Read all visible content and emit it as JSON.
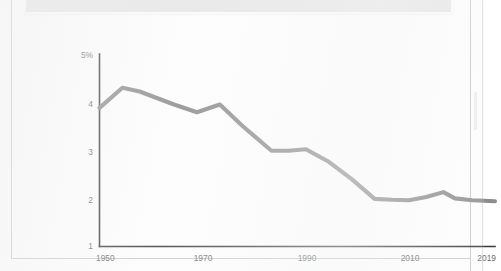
{
  "document": {
    "surface_color": "#fdfdfd",
    "frame_color": "#c9c9c9",
    "top_panel_color": "#e6e6e6"
  },
  "chart_data": {
    "type": "line",
    "title": "",
    "subtitle": "",
    "xlabel": "",
    "ylabel": "",
    "grid": false,
    "legend": null,
    "line_color": "#8d8d8d",
    "axis_color": "#3b3b3b",
    "label_color": "#6b6b6b",
    "xlim": [
      1950,
      2019
    ],
    "ylim": [
      1,
      5
    ],
    "y_tick_labels": [
      "5%",
      "4",
      "3",
      "2",
      "1"
    ],
    "y_ticks": [
      5,
      4,
      3,
      2,
      1
    ],
    "x_tick_labels": [
      "1950",
      "1970",
      "1990",
      "2010",
      "2019"
    ],
    "x_ticks": [
      1950,
      1970,
      1990,
      2010,
      2019
    ],
    "x": [
      1950,
      1954,
      1957,
      1963,
      1967,
      1971,
      1975,
      1980,
      1983,
      1986,
      1990,
      1994,
      1998,
      2001,
      2004,
      2007,
      2010,
      2012,
      2015,
      2019
    ],
    "values": [
      3.88,
      4.3,
      4.22,
      3.95,
      3.79,
      3.95,
      3.5,
      2.99,
      2.99,
      3.02,
      2.76,
      2.4,
      1.99,
      1.97,
      1.96,
      2.03,
      2.13,
      2.0,
      1.96,
      1.94
    ],
    "series": [
      {
        "name": "rate",
        "values": [
          3.88,
          4.3,
          4.22,
          3.95,
          3.79,
          3.95,
          3.5,
          2.99,
          2.99,
          3.02,
          2.76,
          2.4,
          1.99,
          1.97,
          1.96,
          2.03,
          2.13,
          2.0,
          1.96,
          1.94
        ]
      }
    ]
  }
}
